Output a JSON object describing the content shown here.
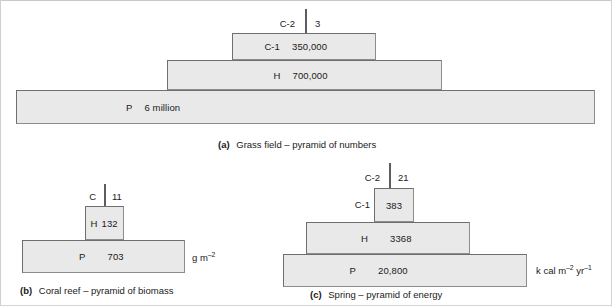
{
  "figure": {
    "background": "#ffffff",
    "bar_fill": "#e9e9e9",
    "bar_border": "#6f6f6f"
  },
  "panels": [
    {
      "id": "a",
      "caption_label": "(a)",
      "caption_text": "Grass field – pyramid of numbers",
      "units": "",
      "tick": {
        "name": "C-2",
        "value": "3"
      },
      "levels": [
        {
          "name": "C-1",
          "value": "350,000"
        },
        {
          "name": "H",
          "value": "700,000"
        },
        {
          "name": "P",
          "value": "6 million"
        }
      ]
    },
    {
      "id": "b",
      "caption_label": "(b)",
      "caption_text": "Coral reef – pyramid of biomass",
      "units_main": "g m",
      "units_sup1": "–2",
      "units_main2": "",
      "units_sup2": "",
      "tick": {
        "name": "C",
        "value": "11"
      },
      "levels": [
        {
          "name": "H",
          "value": "132"
        },
        {
          "name": "P",
          "value": "703"
        }
      ]
    },
    {
      "id": "c",
      "caption_label": "(c)",
      "caption_text": "Spring – pyramid of energy",
      "units_main": "k cal m",
      "units_sup1": "–2",
      "units_main2": " yr",
      "units_sup2": "–1",
      "tick": {
        "name": "C-2",
        "value": "21"
      },
      "external_label": "C-1",
      "levels": [
        {
          "name": "",
          "value": "383"
        },
        {
          "name": "H",
          "value": "3368"
        },
        {
          "name": "P",
          "value": "20,800"
        }
      ]
    }
  ]
}
